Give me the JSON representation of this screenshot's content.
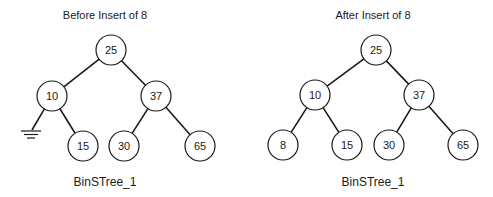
{
  "trees": [
    {
      "id": "before",
      "title": "Before Insert of 8",
      "caption": "BinSTree_1",
      "nodes": [
        {
          "key": "n25",
          "label": "25"
        },
        {
          "key": "n10",
          "label": "10"
        },
        {
          "key": "n37",
          "label": "37"
        },
        {
          "key": "n15",
          "label": "15"
        },
        {
          "key": "n30",
          "label": "30"
        },
        {
          "key": "n65",
          "label": "65"
        }
      ],
      "edges": [
        {
          "from": "n25",
          "to": "n10"
        },
        {
          "from": "n25",
          "to": "n37"
        },
        {
          "from": "n10",
          "to": "null-left"
        },
        {
          "from": "n10",
          "to": "n15"
        },
        {
          "from": "n37",
          "to": "n30"
        },
        {
          "from": "n37",
          "to": "n65"
        }
      ],
      "null_links": [
        {
          "parent": "n10",
          "side": "left",
          "icon": "ground-null-pointer-icon"
        }
      ]
    },
    {
      "id": "after",
      "title": "After Insert of 8",
      "caption": "BinSTree_1",
      "nodes": [
        {
          "key": "n25",
          "label": "25"
        },
        {
          "key": "n10",
          "label": "10"
        },
        {
          "key": "n37",
          "label": "37"
        },
        {
          "key": "n8",
          "label": "8"
        },
        {
          "key": "n15",
          "label": "15"
        },
        {
          "key": "n30",
          "label": "30"
        },
        {
          "key": "n65",
          "label": "65"
        }
      ],
      "edges": [
        {
          "from": "n25",
          "to": "n10"
        },
        {
          "from": "n25",
          "to": "n37"
        },
        {
          "from": "n10",
          "to": "n8"
        },
        {
          "from": "n10",
          "to": "n15"
        },
        {
          "from": "n37",
          "to": "n30"
        },
        {
          "from": "n37",
          "to": "n65"
        }
      ],
      "null_links": []
    }
  ],
  "colors": {
    "stroke": "#1a1a1a",
    "background": "#ffffff"
  }
}
